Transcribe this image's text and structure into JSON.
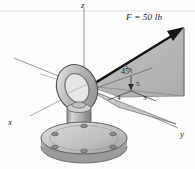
{
  "figure": {
    "background_color": "#fdfdfd",
    "plane_fill": "#b8b8b8",
    "ground_fill": "#c6c6c6",
    "metal_fill": "#b5b5b5",
    "line_color": "#1a1a1a",
    "axis_color": "#8a8a8a"
  },
  "axes": {
    "x_label": "x",
    "y_label": "y",
    "z_label": "z"
  },
  "force": {
    "label": "F = 50 lb",
    "magnitude": 50,
    "units": "lb"
  },
  "angles": {
    "azimuth_label": "45°",
    "azimuth_value": 45
  },
  "slope_triangle": {
    "hypotenuse_label": "5",
    "horizontal_label": "4",
    "vertical_label": "3"
  }
}
